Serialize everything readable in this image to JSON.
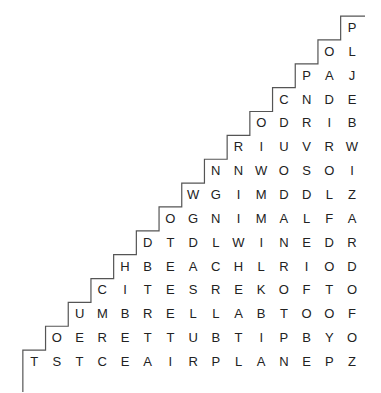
{
  "puzzle": {
    "type": "word-search",
    "shape": "staircase-triangle",
    "line_color": "#555555",
    "text_color": "#222222",
    "rows": [
      "P",
      "OL",
      "PAJ",
      "CNDE",
      "ODRIB",
      "RIUVRW",
      "NNWOSOI",
      "WGIMDDLZ",
      "OGNIMALFA",
      "DTDLWINEDR",
      "HBEACHLRIOD",
      "CITESREKOFTO",
      "UMBRELLABTOOF",
      "OERETTUBTIPBYO",
      "TSTCEAIRPLANEPZ"
    ]
  }
}
